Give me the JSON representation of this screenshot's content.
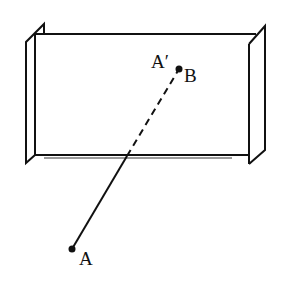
{
  "diagram": {
    "title": "",
    "colors": {
      "stroke": "#111111",
      "background": "#ffffff",
      "shadow": "#9a9a9a"
    },
    "labels": {
      "point_a": "A",
      "image_a_prime": "A′",
      "point_b": "B"
    },
    "points": {
      "A": {
        "x": 72,
        "y": 249
      },
      "A_prime_B": {
        "x": 179,
        "y": 69
      },
      "mirror_intersection": {
        "x": 127,
        "y": 156
      }
    },
    "mirror": {
      "front_rect": {
        "x1": 35,
        "y1": 34,
        "x2": 250,
        "y2": 156
      }
    }
  }
}
